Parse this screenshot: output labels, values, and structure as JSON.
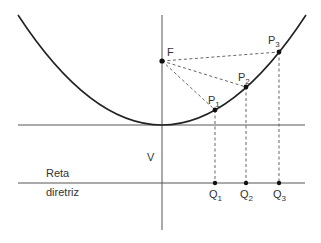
{
  "diagram": {
    "labels": {
      "focus": "F",
      "vertex": "V",
      "directrix_line1": "Reta",
      "directrix_line2": "diretriz",
      "points": [
        {
          "name": "P",
          "sub": "1"
        },
        {
          "name": "P",
          "sub": "2"
        },
        {
          "name": "P",
          "sub": "3"
        }
      ],
      "projections": [
        {
          "name": "Q",
          "sub": "1"
        },
        {
          "name": "Q",
          "sub": "2"
        },
        {
          "name": "Q",
          "sub": "3"
        }
      ]
    },
    "colors": {
      "curve": "#222222",
      "axis": "#555555",
      "dashed": "#555555"
    }
  }
}
